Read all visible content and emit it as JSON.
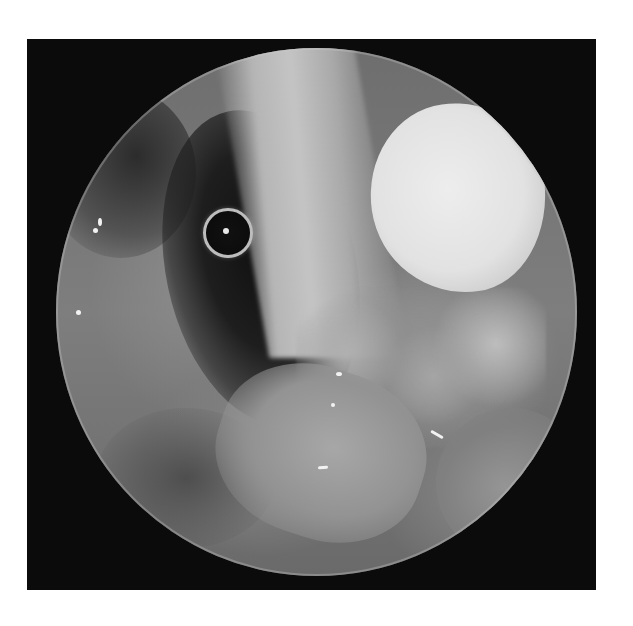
{
  "image": {
    "kind": "grayscale endoscopic photograph",
    "frame_color": "#0b0b0b",
    "background_color": "#ffffff",
    "features": [
      {
        "name": "circular-scope-view",
        "description": "circular endoscope field of view on black square frame"
      },
      {
        "name": "metal-ring-marker",
        "description": "small bright ring with central dot, upper-left of view"
      },
      {
        "name": "white-mass",
        "description": "bright white rounded mass, upper-right of view"
      },
      {
        "name": "dark-lumen",
        "description": "dark cavity region left of center"
      },
      {
        "name": "tissue-column",
        "description": "pale vertical tissue band at top center"
      }
    ]
  }
}
